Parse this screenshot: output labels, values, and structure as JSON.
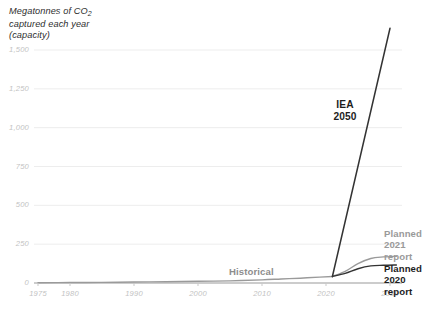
{
  "chart_data": {
    "type": "line",
    "title_line1": "Megatonnes of CO",
    "title_sub": "2",
    "title_line2": "captured each year",
    "title_line3": "(capacity)",
    "xlabel": "",
    "ylabel": "Megatonnes of CO2 captured each year (capacity)",
    "xlim": [
      1975,
      2032
    ],
    "ylim": [
      0,
      1600
    ],
    "grid": true,
    "legend_position": "inline-annotations",
    "xticks": [
      "1975",
      "1980",
      "1990",
      "2000",
      "2010",
      "2020",
      "2030"
    ],
    "xtick_values": [
      1975,
      1980,
      1990,
      2000,
      2010,
      2020,
      2030
    ],
    "yticks": [
      "0",
      "250",
      "500",
      "750",
      "1,000",
      "1,250",
      "1,500"
    ],
    "ytick_values": [
      0,
      250,
      500,
      750,
      1000,
      1250,
      1500
    ],
    "colors": {
      "historical": "#9a9a9a",
      "iea": "#333333",
      "planned_2021": "#9a9a9a",
      "planned_2020": "#333333",
      "grid": "#ededed",
      "axis": "#999999",
      "tick_text": "#c3c3c3"
    },
    "series": [
      {
        "name": "Historical",
        "color": "#9a9a9a",
        "x": [
          1975,
          1980,
          1985,
          1990,
          1995,
          2000,
          2005,
          2010,
          2013,
          2016,
          2019,
          2021
        ],
        "values": [
          2,
          3,
          4,
          6,
          8,
          11,
          14,
          20,
          26,
          31,
          38,
          42
        ]
      },
      {
        "name": "Planned 2021 report",
        "color": "#9a9a9a",
        "x": [
          2021,
          2023,
          2025,
          2027,
          2029,
          2031
        ],
        "values": [
          42,
          75,
          125,
          158,
          168,
          172
        ]
      },
      {
        "name": "Planned 2020 report",
        "color": "#333333",
        "x": [
          2021,
          2023,
          2025,
          2027,
          2029,
          2031
        ],
        "values": [
          42,
          62,
          92,
          110,
          114,
          116
        ]
      },
      {
        "name": "IEA 2050",
        "color": "#333333",
        "x": [
          2021,
          2030
        ],
        "values": [
          42,
          1640
        ]
      }
    ],
    "annotations": [
      {
        "id": "iea",
        "text": "IEA\n2050",
        "line1": "IEA",
        "line2": "2050",
        "color": "#1d1d1d"
      },
      {
        "id": "historical",
        "text": "Historical",
        "color": "#8d8d8d"
      },
      {
        "id": "planned_2021",
        "text": "Planned\n2021\nreport",
        "line1": "Planned",
        "line2": "2021",
        "line3": "report",
        "color": "#9a9a9a"
      },
      {
        "id": "planned_2020",
        "text": "Planned\n2020\nreport",
        "line1": "Planned",
        "line2": "2020",
        "line3": "report",
        "color": "#1d1d1d"
      }
    ]
  }
}
